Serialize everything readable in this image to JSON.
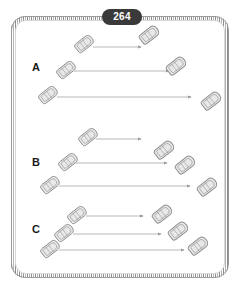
{
  "page": {
    "number": "264",
    "title": "264"
  },
  "frame": {
    "style": "rope-textured-rounded-border",
    "border_color": "#8d8d8d",
    "fill_color": "#ffffff"
  },
  "colors": {
    "badge_background": "#3a3a3a",
    "badge_text": "#ffffff",
    "label_text": "#1a1a1a",
    "boat_outline": "#8a8a8a",
    "boat_fill": "#e8e8e8",
    "arrow_line": "#9a9a9a"
  },
  "groups": [
    {
      "label": "A",
      "label_x": 32,
      "label_y": 61,
      "rows": [
        {
          "start_boat": {
            "x": 84,
            "y": 44,
            "rotation": -38,
            "scale": 1.0
          },
          "end_boat": {
            "x": 149,
            "y": 35,
            "rotation": -38,
            "scale": 1.05
          },
          "arrow": {
            "x1": 93,
            "y1": 47,
            "x2": 141,
            "y2": 47
          }
        },
        {
          "start_boat": {
            "x": 66,
            "y": 70,
            "rotation": -38,
            "scale": 1.0
          },
          "end_boat": {
            "x": 176,
            "y": 66,
            "rotation": -38,
            "scale": 1.05
          },
          "arrow": {
            "x1": 74,
            "y1": 71,
            "x2": 169,
            "y2": 71
          }
        },
        {
          "start_boat": {
            "x": 48,
            "y": 95,
            "rotation": -38,
            "scale": 1.0
          },
          "end_boat": {
            "x": 211,
            "y": 101,
            "rotation": -38,
            "scale": 1.05
          },
          "arrow": {
            "x1": 57,
            "y1": 97,
            "x2": 191,
            "y2": 97
          }
        }
      ]
    },
    {
      "label": "B",
      "label_x": 32,
      "label_y": 156,
      "rows": [
        {
          "start_boat": {
            "x": 88,
            "y": 137,
            "rotation": -38,
            "scale": 1.0
          },
          "end_boat": {
            "x": 164,
            "y": 150,
            "rotation": -38,
            "scale": 1.05
          },
          "arrow": {
            "x1": 96,
            "y1": 139,
            "x2": 141,
            "y2": 139
          }
        },
        {
          "start_boat": {
            "x": 68,
            "y": 162,
            "rotation": -38,
            "scale": 1.0
          },
          "end_boat": {
            "x": 185,
            "y": 165,
            "rotation": -38,
            "scale": 1.05
          },
          "arrow": {
            "x1": 76,
            "y1": 163,
            "x2": 167,
            "y2": 163
          }
        },
        {
          "start_boat": {
            "x": 50,
            "y": 185,
            "rotation": -38,
            "scale": 1.0
          },
          "end_boat": {
            "x": 207,
            "y": 187,
            "rotation": -38,
            "scale": 1.05
          },
          "arrow": {
            "x1": 59,
            "y1": 186,
            "x2": 190,
            "y2": 186
          }
        }
      ]
    },
    {
      "label": "C",
      "label_x": 32,
      "label_y": 223,
      "rows": [
        {
          "start_boat": {
            "x": 77,
            "y": 215,
            "rotation": -38,
            "scale": 1.0
          },
          "end_boat": {
            "x": 162,
            "y": 214,
            "rotation": -38,
            "scale": 1.05
          },
          "arrow": {
            "x1": 86,
            "y1": 216,
            "x2": 143,
            "y2": 216
          }
        },
        {
          "start_boat": {
            "x": 64,
            "y": 233,
            "rotation": -38,
            "scale": 1.0
          },
          "end_boat": {
            "x": 178,
            "y": 231,
            "rotation": -38,
            "scale": 1.05
          },
          "arrow": {
            "x1": 73,
            "y1": 234,
            "x2": 161,
            "y2": 234
          }
        },
        {
          "start_boat": {
            "x": 50,
            "y": 249,
            "rotation": -38,
            "scale": 1.0
          },
          "end_boat": {
            "x": 198,
            "y": 246,
            "rotation": -38,
            "scale": 1.05
          },
          "arrow": {
            "x1": 59,
            "y1": 250,
            "x2": 184,
            "y2": 250
          }
        }
      ]
    }
  ]
}
